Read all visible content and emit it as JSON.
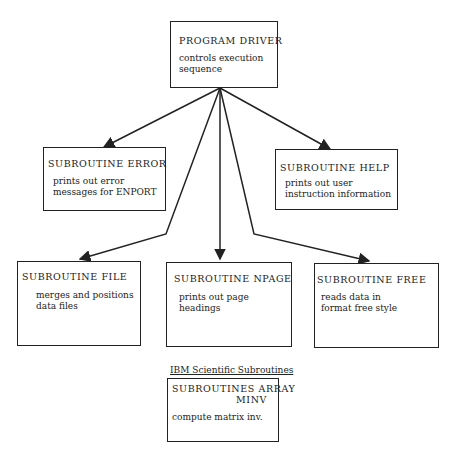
{
  "diagram": {
    "driver": {
      "title": "PROGRAM DRIVER",
      "desc": "controls execution\nsequence"
    },
    "error": {
      "title": "SUBROUTINE ERROR",
      "desc": "prints out error\nmessages for ENPORT"
    },
    "help": {
      "title": "SUBROUTINE HELP",
      "desc": "prints out user\ninstruction information"
    },
    "file": {
      "title": "SUBROUTINE FILE",
      "desc": "merges and positions\ndata files"
    },
    "npage": {
      "title": "SUBROUTINE NPAGE",
      "desc": "prints out page\nheadings"
    },
    "free": {
      "title": "SUBROUTINE FREE",
      "desc": "reads data in\nformat free style"
    },
    "ibm": {
      "label": "IBM Scientific Subroutines",
      "title_line1": "SUBROUTINES ARRAY",
      "title_line2": "MINV",
      "desc": "compute matrix inv."
    },
    "edges": [
      {
        "from": "driver",
        "to": "error"
      },
      {
        "from": "driver",
        "to": "help"
      },
      {
        "from": "driver",
        "to": "file"
      },
      {
        "from": "driver",
        "to": "npage"
      },
      {
        "from": "driver",
        "to": "free"
      }
    ]
  }
}
